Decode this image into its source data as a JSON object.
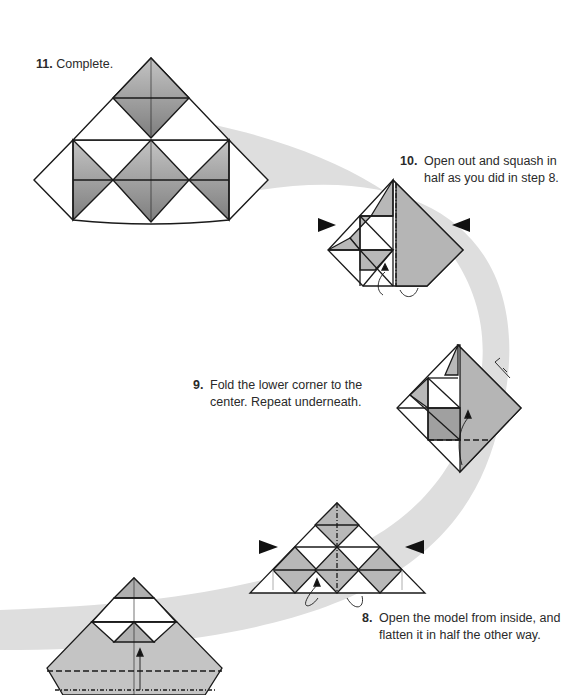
{
  "colors": {
    "band": "#dcdcdc",
    "shade_dark": "#8a8a8a",
    "shade_light": "#b8b8b8",
    "line": "#1a1a1a",
    "arrowhead": "#111111"
  },
  "steps": [
    {
      "number": "11.",
      "text": "Complete."
    },
    {
      "number": "10.",
      "text_line1": "Open out and squash in",
      "text_line2": "half as you did in step 8."
    },
    {
      "number": "9.",
      "text_line1": "Fold the lower corner to the",
      "text_line2": "center. Repeat underneath."
    },
    {
      "number": "8.",
      "text_line1": "Open the model from inside, and",
      "text_line2": "flatten it in half the other way."
    }
  ]
}
